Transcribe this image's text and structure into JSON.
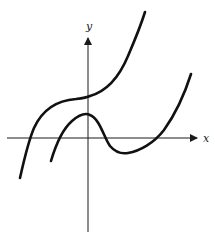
{
  "figure": {
    "axes": {
      "x_label": "x",
      "y_label": "y",
      "x_axis_arrow": true,
      "y_axis_arrow": true,
      "color": "#1a1a1a"
    },
    "curves": [
      {
        "name": "upper-curve",
        "description": "Increasing cubic with horizontal inflection near y-axis, above the x-axis at origin",
        "color": "#111111",
        "path": "M20,178 C24,160 28,142 34,128 C44,106 62,100 76,99 C84,98 88,97 90,96 C104,92 118,80 128,56 C134,42 140,28 145,12"
      },
      {
        "name": "lower-curve",
        "description": "Cubic with local maximum on y-axis and local minimum to the right",
        "color": "#111111",
        "path": "M51,161 C56,144 64,128 72,121 C80,114 86,113 90,115 C100,119 104,138 110,146 C116,153 122,154 128,153 C140,151 154,143 164,130 C174,116 184,96 191,74"
      }
    ]
  }
}
